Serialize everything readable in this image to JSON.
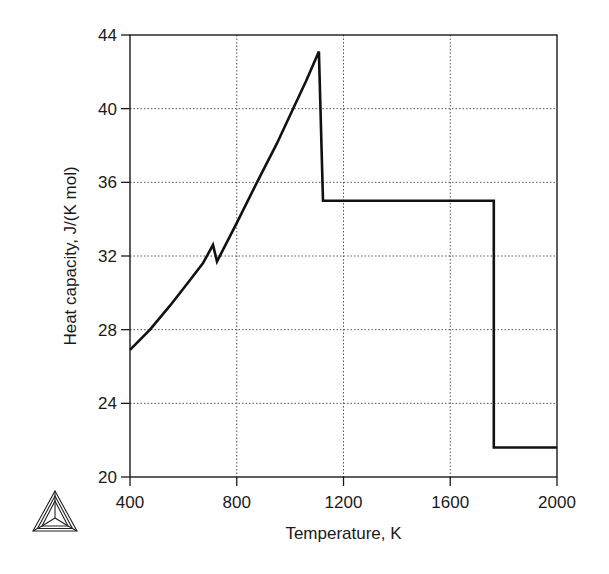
{
  "chart_data": {
    "type": "line",
    "title": "",
    "xlabel": "Temperature, K",
    "ylabel": "Heat capacity, J/(K mol)",
    "xlim": [
      400,
      2000
    ],
    "ylim": [
      20,
      44
    ],
    "xticks": [
      400,
      800,
      1200,
      1600,
      2000
    ],
    "yticks": [
      20,
      24,
      28,
      32,
      36,
      40,
      44
    ],
    "grid": "dotted",
    "legend": null,
    "series": [
      {
        "name": "Heat capacity",
        "x": [
          400,
          475,
          550,
          620,
          673,
          711,
          726,
          800,
          876,
          950,
          1011,
          1060,
          1108,
          1123,
          1500,
          1763,
          1763,
          2000
        ],
        "y": [
          26.9,
          28.0,
          29.3,
          30.6,
          31.6,
          32.6,
          31.7,
          33.8,
          36.0,
          38.1,
          40.0,
          41.5,
          43.1,
          35.0,
          35.0,
          35.0,
          21.6,
          21.6
        ]
      }
    ]
  },
  "logo": {
    "icon": "thermo-calc-triangle-logo"
  },
  "colors": {
    "line": "#111111",
    "axis": "#1a1a1a",
    "grid": "#555555",
    "background": "#ffffff"
  }
}
